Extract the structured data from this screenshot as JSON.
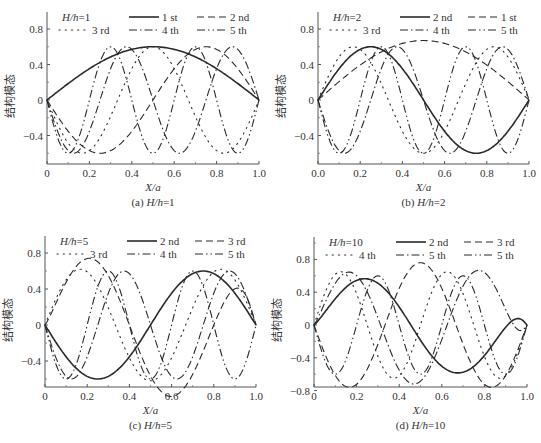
{
  "figure": {
    "y_axis_label": "结构模态",
    "x_axis_label": "X/a",
    "line_styles": {
      "solid": "",
      "dashed": "7,4",
      "dotted": "1.2,5",
      "dashdot": "8,3,1.5,3",
      "dashdotdot": "8,3,1.5,3,1.5,3"
    },
    "line_color": "#2a2a2a"
  },
  "chart_data": [
    {
      "id": "a",
      "type": "line",
      "title": "(a) H/h=1",
      "caption_prefix": "(a) ",
      "caption_ratio": "H/h",
      "caption_value": "=1",
      "legend_title_ratio": "H/h",
      "legend_title_value": "=1",
      "xlabel": "X/a",
      "ylabel": "结构模态",
      "xlim": [
        0,
        1.0
      ],
      "ylim": [
        -0.65,
        1.0
      ],
      "x_ticks": [
        "0",
        "0.2",
        "0.4",
        "0.6",
        "0.8",
        "1.0"
      ],
      "y_ticks": [
        {
          "v": 0.8,
          "label": "0.8"
        },
        {
          "v": 0.4,
          "label": "0.4"
        },
        {
          "v": 0,
          "label": "0"
        },
        {
          "v": -0.4,
          "label": "-0.4"
        }
      ],
      "frame": {
        "x0": 47,
        "x1": 259,
        "y_top": 12,
        "y_bottom": 164,
        "y_zero": 100,
        "px_per_unit": 88.75
      },
      "series": [
        {
          "name": "1 st",
          "style": "solid",
          "amp": 0.6,
          "n": 1,
          "sign": 1,
          "width": 1.6
        },
        {
          "name": "2 nd",
          "style": "dashed",
          "amp": -0.6,
          "n": 2,
          "sign": 1,
          "width": 1.1
        },
        {
          "name": "3 rd",
          "style": "dotted",
          "amp": -0.6,
          "n": 3,
          "sign": 1,
          "width": 1.1
        },
        {
          "name": "4 th",
          "style": "dashdot",
          "amp": -0.6,
          "n": 4,
          "sign": 1,
          "width": 1.1
        },
        {
          "name": "5 th",
          "style": "dashdotdot",
          "amp": -0.6,
          "n": 5,
          "sign": 1,
          "width": 1.1
        }
      ]
    },
    {
      "id": "b",
      "type": "line",
      "title": "(b) H/h=2",
      "caption_prefix": "(b) ",
      "caption_ratio": "H/h",
      "caption_value": "=2",
      "legend_title_ratio": "H/h",
      "legend_title_value": "=2",
      "xlabel": "X/a",
      "ylabel": "结构模态",
      "xlim": [
        0,
        1.0
      ],
      "ylim": [
        -0.65,
        1.0
      ],
      "x_ticks": [
        "0.0",
        "0.2",
        "0.4",
        "0.6",
        "0.8",
        "1.0"
      ],
      "y_ticks": [
        {
          "v": 0.8,
          "label": "0.8"
        },
        {
          "v": 0.4,
          "label": "0.4"
        },
        {
          "v": 0,
          "label": "0"
        },
        {
          "v": -0.4,
          "label": "-0.4"
        }
      ],
      "frame": {
        "x0": 318,
        "x1": 529,
        "y_top": 12,
        "y_bottom": 164,
        "y_zero": 100,
        "px_per_unit": 88.75
      },
      "series": [
        {
          "name": "2 nd",
          "style": "solid",
          "amp": 0.6,
          "n": 2,
          "sign": 1,
          "width": 1.6
        },
        {
          "name": "1 st",
          "style": "dashed",
          "amp": 0.67,
          "n": 1,
          "sign": 1,
          "width": 1.1
        },
        {
          "name": "3 rd",
          "style": "dotted",
          "amp": 0.6,
          "n": 3,
          "sign": 1,
          "width": 1.1
        },
        {
          "name": "4 th",
          "style": "dashdot",
          "amp": -0.6,
          "n": 4,
          "sign": 1,
          "width": 1.1
        },
        {
          "name": "5 th",
          "style": "dashdotdot",
          "amp": -0.6,
          "n": 5,
          "sign": 1,
          "width": 1.1
        }
      ]
    },
    {
      "id": "c",
      "type": "line",
      "title": "(c) H/h=5",
      "caption_prefix": "(c) ",
      "caption_ratio": "H/h",
      "caption_value": "=5",
      "legend_title_ratio": "H/h",
      "legend_title_value": "=5",
      "xlabel": "X/a",
      "ylabel": "结构模态",
      "xlim": [
        0,
        1.0
      ],
      "ylim": [
        -0.65,
        1.0
      ],
      "x_ticks": [
        "0",
        "0.2",
        "0.4",
        "0.6",
        "0.8",
        "1.0"
      ],
      "y_ticks": [
        {
          "v": 0.8,
          "label": "0.8"
        },
        {
          "v": 0.4,
          "label": "0.4"
        },
        {
          "v": 0,
          "label": "0"
        },
        {
          "v": -0.4,
          "label": "-0.4"
        }
      ],
      "frame": {
        "x0": 45,
        "x1": 256,
        "y_top": 236,
        "y_bottom": 387,
        "y_zero": 325,
        "px_per_unit": 90
      },
      "series": [
        {
          "name": "2 nd",
          "style": "solid",
          "amp": -0.6,
          "n": 2,
          "sign": 1,
          "width": 1.6
        },
        {
          "name": "3 rd",
          "style": "dashed",
          "amp": 0.8,
          "n": 2.5,
          "sign": 1,
          "width": 1.1
        },
        {
          "name": "3 rd",
          "style": "dotted",
          "amp": 0.62,
          "n": 3,
          "sign": 1,
          "width": 1.1
        },
        {
          "name": "4 th",
          "style": "dashdot",
          "amp": -0.6,
          "n": 4,
          "sign": 1,
          "width": 1.1
        },
        {
          "name": "5 th",
          "style": "dashdotdot",
          "amp": -0.6,
          "n": 5,
          "sign": 1,
          "width": 1.1
        }
      ]
    },
    {
      "id": "d",
      "type": "line",
      "title": "(d) H/h=10",
      "caption_prefix": "(d) ",
      "caption_ratio": "H/h",
      "caption_value": "=10",
      "legend_title_ratio": "H/h",
      "legend_title_value": "=10",
      "xlabel": "X/a",
      "ylabel": "结构模态",
      "xlim": [
        0,
        1.0
      ],
      "ylim": [
        -0.8,
        1.0
      ],
      "x_ticks": [
        "0",
        "0.2",
        "0.4",
        "0.6",
        "0.8",
        "1.0"
      ],
      "y_ticks": [
        {
          "v": 0.8,
          "label": "0.8"
        },
        {
          "v": 0.4,
          "label": "0.4"
        },
        {
          "v": 0,
          "label": "0"
        },
        {
          "v": -0.4,
          "label": "-0.4"
        },
        {
          "v": -0.8,
          "label": "-0.8"
        }
      ],
      "frame": {
        "x0": 314,
        "x1": 527,
        "y_top": 237,
        "y_bottom": 387,
        "y_zero": 325,
        "px_per_unit": 82
      },
      "series": [
        {
          "name": "2 nd",
          "style": "solid",
          "amp": 0.6,
          "n": 2.2,
          "sign": 1,
          "width": 1.6
        },
        {
          "name": "3 rd",
          "style": "dashed",
          "amp": -0.76,
          "n": 3,
          "sign": 1,
          "width": 1.1
        },
        {
          "name": "4 th",
          "style": "dotted",
          "amp": 0.65,
          "n": 4,
          "sign": 1,
          "width": 1.1
        },
        {
          "name": "5 th",
          "style": "dashdot",
          "amp": 0.72,
          "n": 3.2,
          "sign": 1,
          "width": 1.1
        },
        {
          "name": "5 th",
          "style": "dashdotdot",
          "amp": -0.6,
          "n": 5,
          "sign": 1,
          "width": 1.1
        }
      ]
    }
  ]
}
